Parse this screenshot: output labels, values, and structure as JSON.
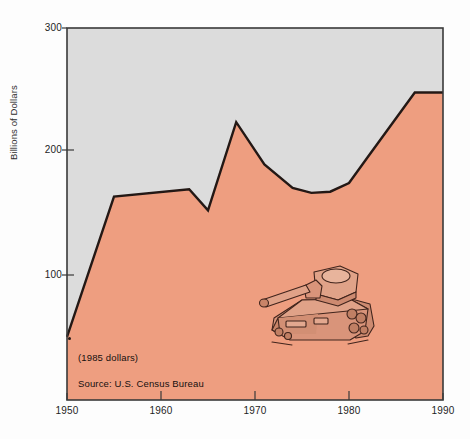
{
  "chart_data": {
    "type": "area",
    "title": "",
    "subtitle": "",
    "xlabel": "",
    "ylabel": "Billions of Dollars",
    "xlim": [
      1950,
      1990
    ],
    "ylim": [
      0,
      300
    ],
    "grid": false,
    "legend_position": "none",
    "x_ticks": [
      "1950",
      "1960",
      "1970",
      "1980",
      "1990"
    ],
    "y_ticks": [
      "100",
      "200",
      "300"
    ],
    "annotations": [
      "(1985 dollars)",
      "Source: U.S. Census Bureau"
    ],
    "fill_color": "#ee9e80",
    "line_color": "#231815",
    "plot_background_color": "#dcdcdc",
    "series": [
      {
        "name": "National defense outlays",
        "x": [
          1950,
          1955,
          1963,
          1965,
          1968,
          1971,
          1974,
          1976,
          1978,
          1980,
          1982,
          1987
        ],
        "values": [
          51,
          164,
          170,
          153,
          224,
          190,
          171,
          167,
          168,
          175,
          196,
          248
        ]
      }
    ]
  },
  "axes": {
    "y_title": "Billions of Dollars",
    "y_ticks": [
      {
        "label": "300",
        "value": 300
      },
      {
        "label": "200",
        "value": 200
      },
      {
        "label": "100",
        "value": 100
      }
    ],
    "x_ticks": [
      {
        "label": "1950",
        "value": 1950
      },
      {
        "label": "1960",
        "value": 1960
      },
      {
        "label": "1970",
        "value": 1970
      },
      {
        "label": "1980",
        "value": 1980
      },
      {
        "label": "1990",
        "value": 1990
      }
    ]
  },
  "notes": {
    "dollars": "(1985 dollars)",
    "source": "Source: U.S. Census Bureau"
  },
  "illustration": {
    "name": "tank-illustration",
    "body_color": "#d9947a",
    "outline_color": "#40241c"
  }
}
